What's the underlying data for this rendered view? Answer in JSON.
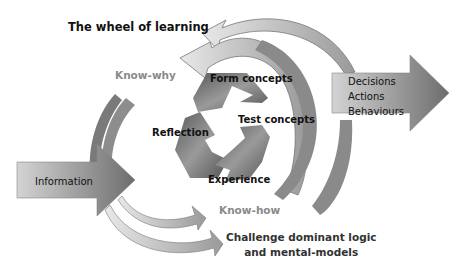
{
  "title": "The wheel of learning",
  "labels": {
    "know_why": "Know-why",
    "know_how": "Know-how",
    "challenge_line1": "Challenge dominant logic",
    "challenge_line2": "and mental-models"
  },
  "cycle": {
    "form_concepts": "Form concepts",
    "test_concepts": "Test concepts",
    "reflection": "Reflection",
    "experience": "Experience"
  },
  "input_arrow": {
    "label": "Information"
  },
  "output_arrow": {
    "line1": "Decisions",
    "line2": "Actions",
    "line3": "Behaviours"
  },
  "colors": {
    "dark_gray": "#555555",
    "mid_gray": "#8a8a8a",
    "light_gray": "#d9d9d9",
    "text": "#111111"
  }
}
